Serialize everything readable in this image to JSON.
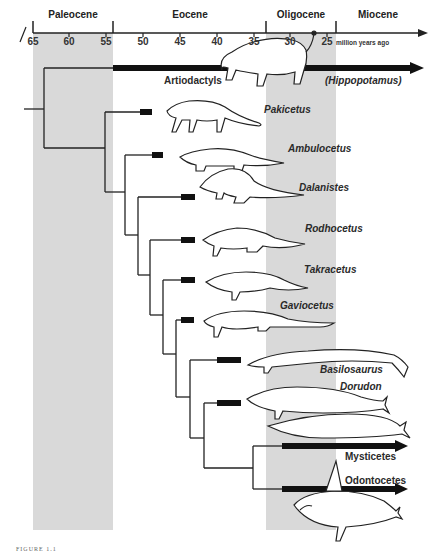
{
  "timescale": {
    "unit_label": "million years ago",
    "ticks": [
      "65",
      "60",
      "55",
      "50",
      "45",
      "40",
      "35",
      "30",
      "25"
    ],
    "periods": [
      "Paleocene",
      "Eocene",
      "Oligocene",
      "Miocene"
    ],
    "shaded_periods": [
      "Paleocene",
      "Oligocene"
    ]
  },
  "taxa": {
    "artiodactyls": "Artiodactyls",
    "hippopotamus": "(Hippopotamus)",
    "pakicetus": "Pakicetus",
    "ambulocetus": "Ambulocetus",
    "dalanistes": "Dalanistes",
    "rodhocetus": "Rodhocetus",
    "takracetus": "Takracetus",
    "gaviocetus": "Gaviocetus",
    "basilosaurus": "Basilosaurus",
    "dorudon": "Dorudon",
    "mysticetes": "Mysticetes",
    "odontocetes": "Odontocetes"
  },
  "caption": "FIGURE 1.1",
  "colors": {
    "shade": "#d9d9d9",
    "line": "#222222",
    "bar": "#111111"
  }
}
